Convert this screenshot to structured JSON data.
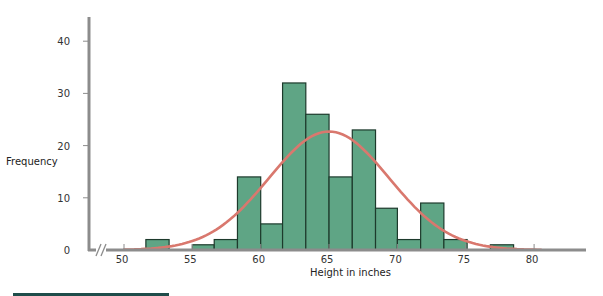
{
  "chart_data": {
    "type": "bar",
    "subtype": "histogram_with_normal_curve",
    "title": "",
    "xlabel": "Height in inches",
    "ylabel": "Frequency",
    "xlim": [
      48.2,
      83.4
    ],
    "ylim": [
      0,
      44
    ],
    "x_ticks": [
      50,
      55,
      60,
      65,
      70,
      75,
      80
    ],
    "y_ticks": [
      0,
      10,
      20,
      30,
      40
    ],
    "bin_width": 1.68,
    "bins": [
      {
        "start": 51.6,
        "end": 53.3,
        "count": 2
      },
      {
        "start": 53.3,
        "end": 55.0,
        "count": 0
      },
      {
        "start": 55.0,
        "end": 56.6,
        "count": 1
      },
      {
        "start": 56.6,
        "end": 58.3,
        "count": 2
      },
      {
        "start": 58.3,
        "end": 60.0,
        "count": 14
      },
      {
        "start": 60.0,
        "end": 61.6,
        "count": 5
      },
      {
        "start": 61.6,
        "end": 63.3,
        "count": 32
      },
      {
        "start": 63.3,
        "end": 65.0,
        "count": 26
      },
      {
        "start": 65.0,
        "end": 66.7,
        "count": 14
      },
      {
        "start": 66.7,
        "end": 68.4,
        "count": 23
      },
      {
        "start": 68.4,
        "end": 70.0,
        "count": 8
      },
      {
        "start": 70.0,
        "end": 71.7,
        "count": 2
      },
      {
        "start": 71.7,
        "end": 73.4,
        "count": 9
      },
      {
        "start": 73.4,
        "end": 75.1,
        "count": 2
      },
      {
        "start": 75.1,
        "end": 76.8,
        "count": 0
      },
      {
        "start": 76.8,
        "end": 78.5,
        "count": 1
      }
    ],
    "curve": {
      "type": "normal",
      "mean": 65,
      "peak": 22.7,
      "sd": 4.4
    },
    "axis_break": "x-axis near origin",
    "grid": false,
    "legend": null,
    "colors": {
      "bar_fill": "#5fa585",
      "bar_stroke": "#1d3a2c",
      "curve": "#d9786e",
      "axis": "#8c8c8c",
      "rule": "#1f4d4a"
    }
  }
}
